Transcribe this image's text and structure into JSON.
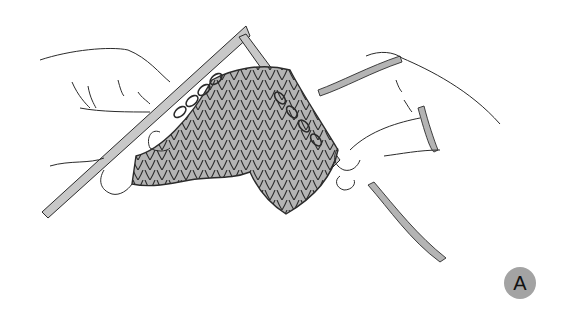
{
  "figure": {
    "step_label": "A",
    "colors": {
      "background": "#ffffff",
      "outline": "#2b2b2b",
      "needle_fill": "#c8c8c8",
      "yarn_fill": "#b4b4b4",
      "badge_fill": "#a3a3a3",
      "badge_text": "#111111"
    }
  }
}
